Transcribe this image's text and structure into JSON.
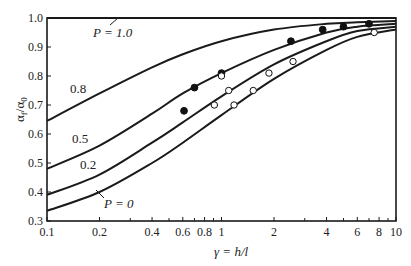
{
  "chart_data": {
    "type": "line",
    "title": "",
    "xlabel": "γ = h/l",
    "ylabel": "αf/α0",
    "xscale": "log",
    "xlim": [
      0.1,
      10
    ],
    "ylim": [
      0.3,
      1.0
    ],
    "x_ticks": [
      "0.1",
      "0.2",
      "0.4",
      "0.6",
      "0.8",
      "1",
      "2",
      "4",
      "6",
      "8",
      "10"
    ],
    "x_tick_values": [
      0.1,
      0.2,
      0.4,
      0.6,
      0.8,
      1,
      2,
      4,
      6,
      8,
      10
    ],
    "y_ticks": [
      "0.3",
      "0.4",
      "0.5",
      "0.6",
      "0.7",
      "0.8",
      "0.9",
      "1.0"
    ],
    "grid": false,
    "series": [
      {
        "name": "P = 1.0",
        "label": "P = 1.0",
        "x": [
          0.1,
          10
        ],
        "y": [
          1.0,
          1.0
        ]
      },
      {
        "name": "0.8",
        "label": "0.8",
        "x": [
          0.1,
          0.2,
          0.4,
          0.6,
          1,
          2,
          4,
          6,
          10
        ],
        "y": [
          0.645,
          0.74,
          0.83,
          0.875,
          0.92,
          0.96,
          0.98,
          0.985,
          0.99
        ]
      },
      {
        "name": "0.5",
        "label": "0.5",
        "x": [
          0.1,
          0.2,
          0.4,
          0.6,
          1,
          2,
          4,
          6,
          10
        ],
        "y": [
          0.48,
          0.56,
          0.67,
          0.74,
          0.81,
          0.89,
          0.95,
          0.97,
          0.98
        ]
      },
      {
        "name": "0.2",
        "label": "0.2",
        "x": [
          0.1,
          0.2,
          0.4,
          0.6,
          1,
          2,
          4,
          6,
          10
        ],
        "y": [
          0.39,
          0.46,
          0.57,
          0.64,
          0.73,
          0.84,
          0.92,
          0.955,
          0.97
        ]
      },
      {
        "name": "P = 0",
        "label": "P = 0",
        "x": [
          0.1,
          0.2,
          0.4,
          0.6,
          1,
          2,
          4,
          6,
          10
        ],
        "y": [
          0.335,
          0.4,
          0.5,
          0.57,
          0.665,
          0.79,
          0.89,
          0.935,
          0.96
        ]
      }
    ],
    "points": [
      {
        "name": "filled",
        "marker": "filled-circle",
        "x": [
          0.61,
          0.7,
          1.0,
          2.5,
          3.8,
          5.0,
          7.0
        ],
        "y": [
          0.68,
          0.76,
          0.81,
          0.92,
          0.96,
          0.97,
          0.98
        ]
      },
      {
        "name": "open",
        "marker": "open-circle",
        "x": [
          0.91,
          1.0,
          1.1,
          1.18,
          1.52,
          1.87,
          2.57,
          7.5
        ],
        "y": [
          0.7,
          0.8,
          0.75,
          0.7,
          0.75,
          0.81,
          0.85,
          0.95
        ]
      }
    ],
    "annotations": [
      "P = 1.0",
      "0.8",
      "0.5",
      "0.2",
      "P = 0"
    ]
  },
  "labels": {
    "ylabel_main": "α",
    "ylabel_sub1": "f",
    "ylabel_mid": "/α",
    "ylabel_sub2": "0",
    "xlabel": "γ = h/l",
    "curve_p10": "P = 1.0",
    "curve_08": "0.8",
    "curve_05": "0.5",
    "curve_02": "0.2",
    "curve_p0": "P = 0"
  }
}
